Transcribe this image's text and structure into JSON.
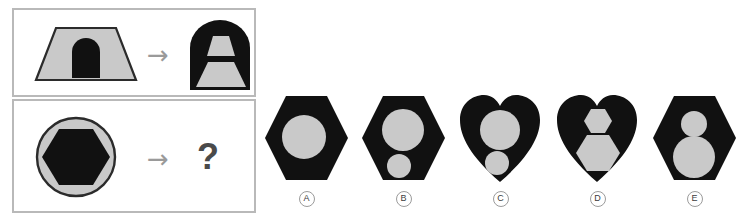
{
  "puzzle": {
    "type": "visual-analogy-matrix",
    "colors": {
      "black": "#111111",
      "gray_fill": "#c9c9c9",
      "outline": "#2b2b2b",
      "panel_border": "#b9b9b9",
      "arrow": "#9a9a9a",
      "question": "#4a4a4a",
      "background": "#ffffff"
    },
    "rows": [
      {
        "name": "example-row",
        "source": {
          "description": "gray trapezoid containing a black arch",
          "outer_shape": "trapezoid",
          "outer_fill": "gray",
          "inner_shape": "arch",
          "inner_fill": "black"
        },
        "operator": "→",
        "result": {
          "description": "black arch containing a small gray trapezoid above a large gray trapezoid",
          "outer_shape": "arch",
          "outer_fill": "black",
          "inner_shapes": [
            "small-trapezoid",
            "large-trapezoid"
          ],
          "inner_fill": "gray"
        }
      },
      {
        "name": "question-row",
        "source": {
          "description": "gray circle containing a black hexagon",
          "outer_shape": "circle",
          "outer_fill": "gray",
          "inner_shape": "hexagon",
          "inner_fill": "black"
        },
        "operator": "→",
        "result": {
          "description": "unknown",
          "placeholder": "?"
        }
      }
    ],
    "answers": {
      "label_prefix": "",
      "options": [
        {
          "label": "A",
          "outer_shape": "hexagon",
          "outer_fill": "black",
          "inner": [
            {
              "shape": "circle",
              "size": "large",
              "fill": "gray",
              "position": "center"
            }
          ]
        },
        {
          "label": "B",
          "outer_shape": "hexagon",
          "outer_fill": "black",
          "inner": [
            {
              "shape": "circle",
              "size": "large",
              "fill": "gray",
              "position": "upper"
            },
            {
              "shape": "circle",
              "size": "small",
              "fill": "gray",
              "position": "lower"
            }
          ]
        },
        {
          "label": "C",
          "outer_shape": "heart",
          "outer_fill": "black",
          "inner": [
            {
              "shape": "circle",
              "size": "large",
              "fill": "gray",
              "position": "upper"
            },
            {
              "shape": "circle",
              "size": "small",
              "fill": "gray",
              "position": "lower"
            }
          ]
        },
        {
          "label": "D",
          "outer_shape": "heart",
          "outer_fill": "black",
          "inner": [
            {
              "shape": "hexagon",
              "size": "small",
              "fill": "gray",
              "position": "upper"
            },
            {
              "shape": "hexagon",
              "size": "large",
              "fill": "gray",
              "position": "lower"
            }
          ]
        },
        {
          "label": "E",
          "outer_shape": "hexagon",
          "outer_fill": "black",
          "inner": [
            {
              "shape": "circle",
              "size": "small",
              "fill": "gray",
              "position": "upper"
            },
            {
              "shape": "circle",
              "size": "large",
              "fill": "gray",
              "position": "lower"
            }
          ]
        }
      ]
    },
    "symbols": {
      "arrow": "→",
      "question": "?"
    }
  }
}
